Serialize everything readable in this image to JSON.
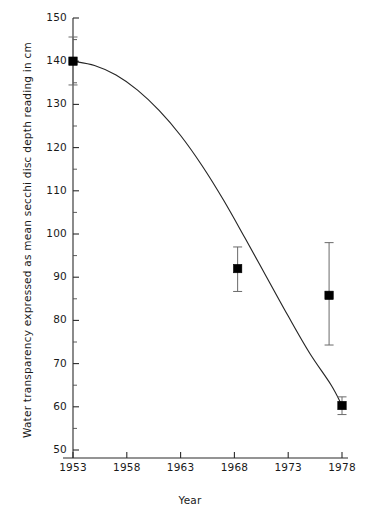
{
  "chart_data": {
    "type": "scatter",
    "title": "",
    "xlabel": "Year",
    "ylabel": "Water transparency expressed as mean secchi disc depth reading in cm",
    "xlim": [
      1950.5,
      1979.5
    ],
    "ylim": [
      46,
      152
    ],
    "grid": false,
    "legend": "none",
    "x_ticks": [
      1953,
      1958,
      1963,
      1968,
      1973,
      1978
    ],
    "x_tick_labels": [
      "1953",
      "1958",
      "1963",
      "1968",
      "1973",
      "1978"
    ],
    "y_ticks": [
      50,
      60,
      70,
      80,
      90,
      100,
      110,
      120,
      130,
      140,
      150
    ],
    "y_tick_labels": [
      "50",
      "60",
      "70",
      "80",
      "90",
      "100",
      "110",
      "120",
      "130",
      "140",
      "150"
    ],
    "y_minor_ticks": [
      55,
      65,
      75,
      85,
      95,
      105,
      115,
      125,
      135,
      145
    ],
    "series": [
      {
        "name": "mean secchi disc depth",
        "marker": "filled-square",
        "points": [
          {
            "x": 1953.0,
            "y": 140.0,
            "y_low": 134.5,
            "y_high": 145.6
          },
          {
            "x": 1968.3,
            "y": 92.0,
            "y_low": 86.7,
            "y_high": 97.0
          },
          {
            "x": 1976.8,
            "y": 85.8,
            "y_low": 74.3,
            "y_high": 98.0
          },
          {
            "x": 1978.0,
            "y": 60.3,
            "y_low": 58.2,
            "y_high": 62.3
          }
        ]
      },
      {
        "name": "fitted trend curve",
        "type": "line",
        "points": [
          {
            "x": 1953.0,
            "y": 140.0
          },
          {
            "x": 1955.0,
            "y": 139.0
          },
          {
            "x": 1957.0,
            "y": 136.8
          },
          {
            "x": 1959.0,
            "y": 133.3
          },
          {
            "x": 1961.0,
            "y": 128.6
          },
          {
            "x": 1963.0,
            "y": 122.8
          },
          {
            "x": 1965.0,
            "y": 115.8
          },
          {
            "x": 1967.0,
            "y": 107.8
          },
          {
            "x": 1969.0,
            "y": 99.0
          },
          {
            "x": 1971.0,
            "y": 90.0
          },
          {
            "x": 1973.0,
            "y": 81.0
          },
          {
            "x": 1975.0,
            "y": 72.4
          },
          {
            "x": 1977.0,
            "y": 65.0
          },
          {
            "x": 1978.0,
            "y": 60.3
          }
        ]
      }
    ]
  },
  "axes": {
    "y_title": "Water transparency expressed as mean secchi disc depth reading in cm",
    "x_title": "Year"
  },
  "colors": {
    "marker": "#000000",
    "curve": "#262626",
    "errorbar": "#6a6a6a",
    "axis": "#2b2b2b",
    "background": "#ffffff"
  }
}
